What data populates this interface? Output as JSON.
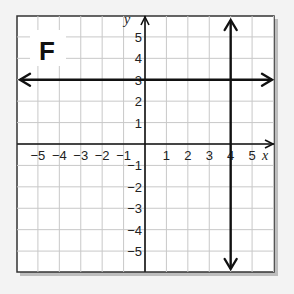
{
  "panel": {
    "label": "F"
  },
  "chart_data": {
    "type": "line",
    "title": "F",
    "xlabel": "x",
    "ylabel": "y",
    "xlim": [
      -5.5,
      6.5
    ],
    "ylim": [
      -5.5,
      6.4
    ],
    "grid": true,
    "x_ticks": [
      "-5",
      "-4",
      "-3",
      "-2",
      "-1",
      "1",
      "2",
      "3",
      "4",
      "5"
    ],
    "y_ticks": [
      "5",
      "4",
      "3",
      "2",
      "1",
      "-1",
      "-2",
      "-3",
      "-4",
      "-5"
    ],
    "series": [
      {
        "name": "horizontal line y = 3",
        "equation": "y = 3",
        "points": [
          [
            -5.5,
            3
          ],
          [
            6.5,
            3
          ]
        ],
        "arrows": "both"
      },
      {
        "name": "vertical line x = 4",
        "equation": "x = 4",
        "points": [
          [
            4,
            -5.5
          ],
          [
            4,
            5.8
          ]
        ],
        "arrows": "both"
      }
    ]
  },
  "colors": {
    "grid": "#c8c8c8",
    "axis": "#111111",
    "line": "#111111",
    "background": "#ffffff",
    "frame": "#333333"
  }
}
